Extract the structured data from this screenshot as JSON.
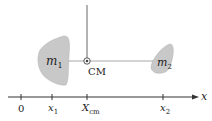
{
  "diagram": {
    "masses": [
      {
        "label": "m",
        "subscript": "1",
        "fill": "#c8c8c8"
      },
      {
        "label": "m",
        "subscript": "2",
        "fill": "#c8c8c8"
      }
    ],
    "center_of_mass": {
      "label": "CM"
    },
    "axis": {
      "label": "x",
      "ticks": [
        {
          "main": "0",
          "sub": ""
        },
        {
          "main": "x",
          "sub": "1"
        },
        {
          "main": "X",
          "sub": "cm"
        },
        {
          "main": "x",
          "sub": "2"
        }
      ]
    },
    "colors": {
      "line": "#333333",
      "connector": "#9a9a9a",
      "blob": "#c8c8c8"
    }
  }
}
